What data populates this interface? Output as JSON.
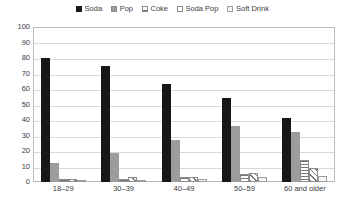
{
  "chart_data": {
    "type": "bar",
    "title": "",
    "xlabel": "",
    "ylabel": "",
    "ylim": [
      0,
      100
    ],
    "ytick_step": 10,
    "yticks": [
      100,
      90,
      80,
      70,
      60,
      50,
      40,
      30,
      20,
      10,
      0
    ],
    "grid": true,
    "legend_position": "top-center",
    "categories": [
      "18–29",
      "30–39",
      "40–49",
      "50–59",
      "60 and older"
    ],
    "series": [
      {
        "name": "Soda",
        "swatch": "solid-black",
        "color": "#171717",
        "values": [
          80,
          75,
          63,
          54,
          41
        ]
      },
      {
        "name": "Pop",
        "swatch": "solid-gray",
        "color": "#9c9c9c",
        "values": [
          12,
          19,
          27,
          36,
          32
        ]
      },
      {
        "name": "Coke",
        "swatch": "horizontal-lines",
        "color": "#777777",
        "values": [
          2,
          2,
          3,
          5,
          14
        ]
      },
      {
        "name": "Soda Pop",
        "swatch": "diagonal-lines",
        "color": "#777777",
        "values": [
          2,
          3,
          3,
          6,
          9
        ]
      },
      {
        "name": "Soft Drink",
        "swatch": "light-dotted",
        "color": "#f0f0f0",
        "values": [
          1,
          1,
          2,
          3,
          4
        ]
      }
    ]
  },
  "legend": {
    "items": [
      {
        "label": "Soda"
      },
      {
        "label": "Pop"
      },
      {
        "label": "Coke"
      },
      {
        "label": "Soda Pop"
      },
      {
        "label": "Soft Drink"
      }
    ]
  }
}
